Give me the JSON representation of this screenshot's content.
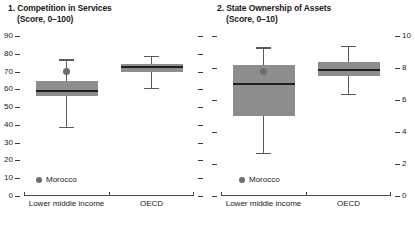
{
  "chart_data": [
    {
      "type": "box",
      "panel_number": "1.",
      "title": "1. Competition in Services",
      "subtitle": "(Score, 0–100)",
      "title_line1": "1. Competition in Services",
      "title_line2": "(Score, 0–100)",
      "xlabel": "",
      "ylabel": "Score, 0–100",
      "ylim": [
        0,
        90
      ],
      "yticks": [
        0,
        10,
        20,
        30,
        40,
        50,
        60,
        70,
        80,
        90
      ],
      "ytick_labels": [
        "0",
        "10",
        "20",
        "30",
        "40",
        "50",
        "60",
        "70",
        "80",
        "90"
      ],
      "ytick_side": "left",
      "ytick_mirror_unlabeled": true,
      "grid": false,
      "legend_position": "inside-bottom-left",
      "categories": [
        "Lower middle income",
        "OECD"
      ],
      "boxes": [
        {
          "category": "Lower middle income",
          "whisker_low": 38,
          "q1": 56,
          "median": 59,
          "q3": 64.5,
          "whisker_high": 77,
          "marker_label": "Morocco",
          "marker_value": 70
        },
        {
          "category": "OECD",
          "whisker_low": 60,
          "q1": 70,
          "median": 72.5,
          "q3": 74.5,
          "whisker_high": 79,
          "marker_label": null,
          "marker_value": null
        }
      ],
      "legend": [
        {
          "label": "Morocco",
          "marker": "circle",
          "color": "#6d6d6d"
        }
      ]
    },
    {
      "type": "box",
      "panel_number": "2.",
      "title": "2. State Ownership of Assets",
      "subtitle": "(Score, 0–10)",
      "title_line1": "2. State Ownership of Assets",
      "title_line2": "(Score, 0–10)",
      "xlabel": "",
      "ylabel": "Score, 0–10",
      "ylim": [
        0,
        10
      ],
      "yticks": [
        0,
        2,
        4,
        6,
        8,
        10
      ],
      "ytick_labels": [
        "0",
        "2",
        "4",
        "6",
        "8",
        "10"
      ],
      "ytick_side": "right",
      "ytick_mirror_unlabeled": true,
      "grid": false,
      "legend_position": "inside-bottom-left",
      "categories": [
        "Lower middle income",
        "OECD"
      ],
      "boxes": [
        {
          "category": "Lower middle income",
          "whisker_low": 2.6,
          "q1": 5.0,
          "median": 7.0,
          "q3": 8.2,
          "whisker_high": 9.3,
          "marker_label": "Morocco",
          "marker_value": 7.8
        },
        {
          "category": "OECD",
          "whisker_low": 6.3,
          "q1": 7.5,
          "median": 7.85,
          "q3": 8.35,
          "whisker_high": 9.4,
          "marker_label": null,
          "marker_value": null
        }
      ],
      "legend": [
        {
          "label": "Morocco",
          "marker": "circle",
          "color": "#6d6d6d"
        }
      ]
    }
  ],
  "colors": {
    "box_fill": "#8d8d8d",
    "median": "#1f1f1f",
    "whisker": "#5a5a5a",
    "marker": "#6d6d6d",
    "axis": "#4a4a4a",
    "text": "#1a1a1a",
    "background": "#ffffff"
  }
}
